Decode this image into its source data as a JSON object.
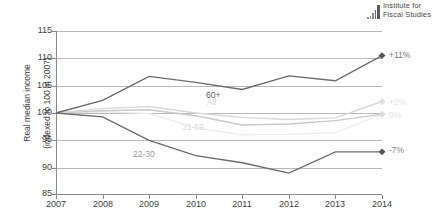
{
  "logo": {
    "line1": "Institute for",
    "line2": "Fiscal Studies",
    "icon": "bar-chart-logo-icon"
  },
  "chart_data": {
    "type": "line",
    "title": "",
    "xlabel": "",
    "ylabel": "Real median income (indexed to 100 in 2007)",
    "ylabel_line1": "Real median income",
    "ylabel_line2": "(indexed to 100 in 2007)",
    "x": [
      2007,
      2008,
      2009,
      2010,
      2011,
      2012,
      2013,
      2014
    ],
    "xticks": [
      "2007",
      "2008",
      "2009",
      "2010",
      "2011",
      "2012",
      "2013",
      "2014"
    ],
    "yticks": [
      "85",
      "90",
      "95",
      "100",
      "105",
      "110",
      "115"
    ],
    "ylim": [
      85,
      115
    ],
    "xlim": [
      2007,
      2014
    ],
    "grid": true,
    "legend": "inline-labels",
    "series": [
      {
        "name": "60+",
        "label": "60+",
        "color": "#6b6b6b",
        "values": [
          100.0,
          102.3,
          106.7,
          105.6,
          104.3,
          106.8,
          105.9,
          110.5
        ],
        "end_annotation": "+11%",
        "marker": "diamond"
      },
      {
        "name": "All",
        "label": "All",
        "color": "#d8d8d8",
        "values": [
          100.0,
          100.8,
          101.2,
          100.0,
          99.2,
          98.8,
          99.1,
          102.1
        ],
        "end_annotation": "+2%",
        "marker": "diamond"
      },
      {
        "name": "31-59",
        "label": "31-59",
        "color": "#c9c9c9",
        "values": [
          100.0,
          100.4,
          100.6,
          99.5,
          97.8,
          98.0,
          98.6,
          99.8
        ],
        "end_annotation": "0%",
        "marker": "diamond"
      },
      {
        "name": "22-30",
        "label": "22-30",
        "color": "#ededed",
        "values": [
          100.0,
          100.2,
          99.9,
          97.3,
          96.0,
          96.1,
          96.4,
          99.8
        ],
        "end_annotation": "",
        "marker": "none"
      },
      {
        "name": "22-30-dark",
        "label": "22-30",
        "color": "#6b6b6b",
        "values": [
          100.0,
          99.3,
          95.0,
          92.2,
          90.9,
          89.0,
          92.9,
          92.9
        ],
        "end_annotation": "-7%",
        "marker": "diamond"
      }
    ],
    "annotations": [
      {
        "text": "60+",
        "series": "60+"
      },
      {
        "text": "All",
        "series": "All"
      },
      {
        "text": "31-59",
        "series": "31-59"
      },
      {
        "text": "22-30",
        "series": "22-30-dark"
      }
    ]
  }
}
